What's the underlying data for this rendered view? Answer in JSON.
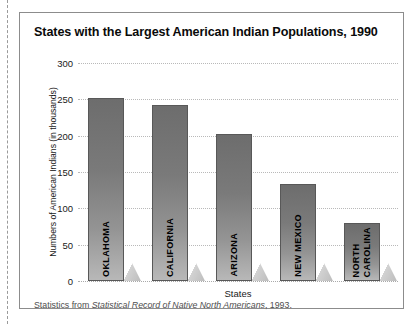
{
  "figure": {
    "title": "States with the Largest American Indian Populations, 1990",
    "caption_prefix": "Statistics from ",
    "caption_source": "Statistical Record of Native North Americans",
    "caption_suffix": ", 1993."
  },
  "chart_data": {
    "type": "bar",
    "title": "States with the Largest American Indian Populations, 1990",
    "xlabel": "States",
    "ylabel": "Numbers of American Indians (in thousands)",
    "categories": [
      "OKLAHOMA",
      "CALIFORNIA",
      "ARIZONA",
      "NEW MEXICO",
      "NORTH\nCAROLINA"
    ],
    "values": [
      252,
      242,
      203,
      134,
      80
    ],
    "ylim": [
      0,
      300
    ],
    "yticks": [
      0,
      50,
      100,
      150,
      200,
      250,
      300
    ],
    "ytick_labels": [
      "0",
      "50",
      "100",
      "150",
      "200",
      "250",
      "300"
    ],
    "grid": true,
    "legend": false,
    "bar_color_top": "#6d6d6d",
    "bar_color_bottom": "#b8b8b8",
    "bar_border_color": "#585858",
    "shadow_color": "#c4c4c4",
    "frame_color": "#8c8c8c",
    "background": "#ffffff"
  }
}
